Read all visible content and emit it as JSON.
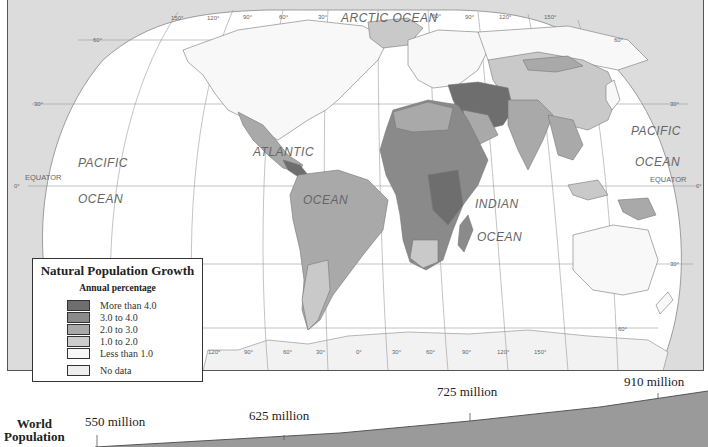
{
  "map": {
    "ocean_labels": {
      "arctic": "ARCTIC OCEAN",
      "pacific_west_1": "PACIFIC",
      "pacific_west_2": "OCEAN",
      "atlantic_1": "ATLANTIC",
      "atlantic_2": "OCEAN",
      "indian_1": "INDIAN",
      "indian_2": "OCEAN",
      "pacific_east_1": "PACIFIC",
      "pacific_east_2": "OCEAN"
    },
    "equator_label": "EQUATOR",
    "top_longitudes": [
      "150°",
      "120°",
      "90°",
      "60°",
      "30°",
      "60°",
      "90°",
      "120°",
      "150°"
    ],
    "bottom_longitudes": [
      "120°",
      "90°",
      "60°",
      "30°",
      "0°",
      "30°",
      "60°",
      "90°",
      "120°",
      "150°"
    ],
    "latitudes": {
      "n60": "60°",
      "n30": "30°",
      "eq": "0°",
      "s30": "30°",
      "s60": "60°"
    },
    "colors": {
      "frame_bg": "#dcdcdc",
      "water": "#ffffff",
      "more_than_4": "#6e6e6e",
      "3_to_4": "#8a8a8a",
      "2_to_3": "#a9a9a9",
      "1_to_2": "#c9c9c9",
      "less_than_1": "#f6f6f6",
      "no_data": "#eeeeee"
    }
  },
  "legend": {
    "title": "Natural Population Growth",
    "subtitle": "Annual percentage",
    "items": [
      {
        "label": "More than 4.0",
        "color": "#6e6e6e"
      },
      {
        "label": "3.0 to 4.0",
        "color": "#8a8a8a"
      },
      {
        "label": "2.0 to 3.0",
        "color": "#a9a9a9"
      },
      {
        "label": "1.0 to 2.0",
        "color": "#cdcdcd"
      },
      {
        "label": "Less than 1.0",
        "color": "#f8f8f8"
      },
      {
        "label": "No data",
        "color": "#eeeeee"
      }
    ]
  },
  "timeline": {
    "title_line1": "World",
    "title_line2": "Population",
    "points": [
      {
        "label": "550 million"
      },
      {
        "label": "625 million"
      },
      {
        "label": "725 million"
      },
      {
        "label": "910 million"
      }
    ]
  }
}
